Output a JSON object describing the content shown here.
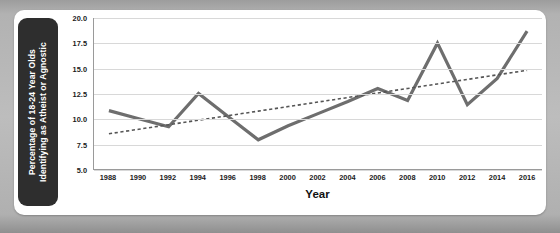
{
  "card": {
    "background_color": "#ffffff",
    "page_background_color": "#b6b6b6"
  },
  "y_axis_title_block": {
    "background_color": "#2e2e2e",
    "text_color": "#ffffff",
    "line1": "Percentage of 18-24 Year Olds",
    "line2": "Identifying as Atheist or Agnostic"
  },
  "chart_data": {
    "type": "line",
    "title": "",
    "subtitle": "",
    "xlabel": "Year",
    "ylabel": "Percentage of 18-24 Year Olds Identifying as Atheist or Agnostic",
    "x": [
      1988,
      1990,
      1992,
      1994,
      1996,
      1998,
      2000,
      2002,
      2004,
      2006,
      2008,
      2010,
      2012,
      2014,
      2016
    ],
    "xlim": [
      1987,
      2017
    ],
    "ylim": [
      5.0,
      20.0
    ],
    "xticks": [
      1988,
      1990,
      1992,
      1994,
      1996,
      1998,
      2000,
      2002,
      2004,
      2006,
      2008,
      2010,
      2012,
      2014,
      2016
    ],
    "yticks": [
      5.0,
      7.5,
      10.0,
      12.5,
      15.0,
      17.5,
      20.0
    ],
    "ytick_labels": [
      "5.0",
      "7.5",
      "10.0",
      "12.5",
      "15.0",
      "17.5",
      "20.0"
    ],
    "grid": true,
    "grid_axis": "y",
    "grid_color": "#d8d8d8",
    "legend": false,
    "legend_position": "none",
    "series": [
      {
        "name": "Percentage atheist or agnostic",
        "style": "solid",
        "color": "#6e6e6e",
        "line_width": 3.2,
        "values": [
          10.8,
          10.0,
          9.2,
          12.5,
          10.2,
          7.9,
          9.3,
          10.5,
          11.7,
          13.0,
          11.8,
          17.5,
          11.4,
          14.0,
          18.7
        ]
      },
      {
        "name": "Linear trend",
        "style": "dotted",
        "color": "#555555",
        "line_width": 1.6,
        "values": [
          8.5,
          8.95,
          9.4,
          9.85,
          10.3,
          10.75,
          11.2,
          11.65,
          12.1,
          12.55,
          13.0,
          13.45,
          13.9,
          14.35,
          14.8
        ]
      }
    ]
  }
}
